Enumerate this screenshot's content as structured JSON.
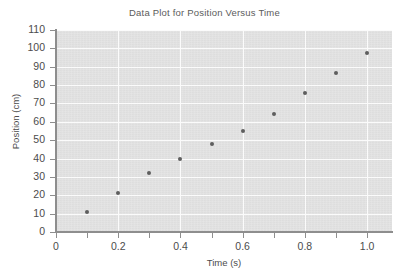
{
  "chart_data": {
    "type": "scatter",
    "title": "Data Plot for Position Versus Time",
    "xlabel": "Time (s)",
    "ylabel": "Position (cm)",
    "xlim": [
      0,
      1.08
    ],
    "ylim": [
      0,
      110
    ],
    "grid": true,
    "legend": null,
    "x": [
      0.1,
      0.2,
      0.3,
      0.4,
      0.5,
      0.6,
      0.7,
      0.8,
      0.9,
      1.0
    ],
    "values": [
      11,
      21.5,
      32,
      40,
      48,
      55,
      64.5,
      75.5,
      86.5,
      97.5
    ],
    "points": [
      {
        "x": 0.1,
        "y": 11
      },
      {
        "x": 0.2,
        "y": 21.5
      },
      {
        "x": 0.3,
        "y": 32
      },
      {
        "x": 0.4,
        "y": 40
      },
      {
        "x": 0.5,
        "y": 48
      },
      {
        "x": 0.6,
        "y": 55
      },
      {
        "x": 0.7,
        "y": 64.5
      },
      {
        "x": 0.8,
        "y": 75.5
      },
      {
        "x": 0.9,
        "y": 86.5
      },
      {
        "x": 1.0,
        "y": 97.5
      }
    ],
    "y_ticks": [
      0,
      10,
      20,
      30,
      40,
      50,
      60,
      70,
      80,
      90,
      100,
      110
    ],
    "y_tick_labels": [
      "0",
      "10",
      "20",
      "30",
      "40",
      "50",
      "60",
      "70",
      "80",
      "90",
      "100",
      "110"
    ],
    "x_ticks": [
      0,
      0.1,
      0.2,
      0.3,
      0.4,
      0.5,
      0.6,
      0.7,
      0.8,
      0.9,
      1.0
    ],
    "x_tick_labels": [
      "0",
      "",
      "0.2",
      "",
      "0.4",
      "",
      "0.6",
      "",
      "0.8",
      "",
      "1.0"
    ],
    "marker_color": "#5e5e5e",
    "plot_bg_color": "#e3e3e3",
    "gridline_color": "#fbfbfb",
    "axis_color": "#8e8e8e",
    "text_color": "#4c4c4c"
  }
}
